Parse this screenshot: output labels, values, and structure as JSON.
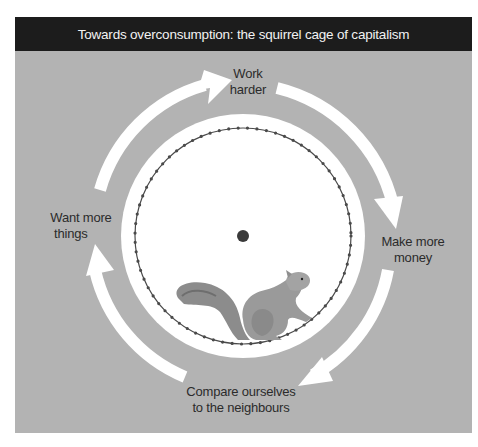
{
  "figure": {
    "title": "Towards overconsumption: the squirrel cage of capitalism",
    "cycle_steps": [
      {
        "id": "work-harder",
        "line1": "Work",
        "line2": "harder"
      },
      {
        "id": "make-more-money",
        "line1": "Make more",
        "line2": "money"
      },
      {
        "id": "compare-to-neighbours",
        "line1": "Compare ourselves",
        "line2": "to the neighbours"
      },
      {
        "id": "want-more-things",
        "line1": "Want more",
        "line2": "things"
      }
    ],
    "center_image": "squirrel-in-wheel",
    "colors": {
      "header_bg": "#1c1c1c",
      "panel_bg": "#b3b3b3",
      "arrows": "#ffffff",
      "wheel_rim": "#555555",
      "text": "#2b2b2b"
    }
  }
}
